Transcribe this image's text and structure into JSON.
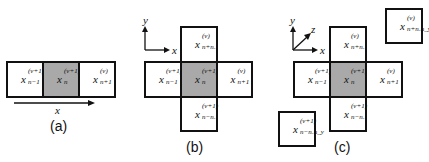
{
  "panels": {
    "a": {
      "caption": "(a)",
      "axis": {
        "x": "x"
      },
      "cells": {
        "left": {
          "base": "x",
          "sup": "(ν+1)",
          "sub": "n−1"
        },
        "center": {
          "base": "x",
          "sup": "(ν+1)",
          "sub": "n"
        },
        "right": {
          "base": "x",
          "sup": "(ν)",
          "sub": "n+1"
        }
      }
    },
    "b": {
      "caption": "(b)",
      "axis": {
        "x": "x",
        "y": "y"
      },
      "cells": {
        "top": {
          "base": "x",
          "sup": "(ν)",
          "sub": "n+nₓ"
        },
        "left": {
          "base": "x",
          "sup": "(ν+1)",
          "sub": "n−1"
        },
        "center": {
          "base": "x",
          "sup": "(ν+1)",
          "sub": "n"
        },
        "right": {
          "base": "x",
          "sup": "(ν)",
          "sub": "n+1"
        },
        "bottom": {
          "base": "x",
          "sup": "(ν+1)",
          "sub": "n−nₓ"
        }
      }
    },
    "c": {
      "caption": "(c)",
      "axis": {
        "x": "x",
        "y": "y",
        "z": "z"
      },
      "cells": {
        "far": {
          "base": "x",
          "sup": "(ν)",
          "sub": "n+nₓn_y"
        },
        "top": {
          "base": "x",
          "sup": "(ν)",
          "sub": "n+nₓ"
        },
        "left": {
          "base": "x",
          "sup": "(ν+1)",
          "sub": "n−1"
        },
        "center": {
          "base": "x",
          "sup": "(ν+1)",
          "sub": "n"
        },
        "right": {
          "base": "x",
          "sup": "(ν)",
          "sub": "n+1"
        },
        "bottom": {
          "base": "x",
          "sup": "(ν+1)",
          "sub": "n−nₓ"
        },
        "near": {
          "base": "x",
          "sup": "(ν+1)",
          "sub": "n−nₓn_y"
        }
      }
    }
  },
  "colors": {
    "center_fill": "#a9a9a9",
    "border": "#111111"
  }
}
